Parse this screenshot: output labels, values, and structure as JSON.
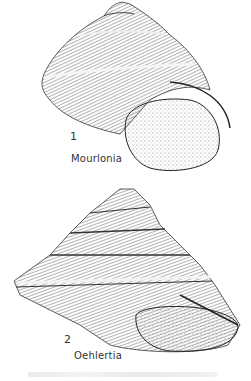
{
  "figures": [
    {
      "number": "1",
      "genus": "Mourlonia"
    },
    {
      "number": "2",
      "genus": "Oehlertia"
    }
  ],
  "colors": {
    "ink": "#222222",
    "background": "#ffffff"
  }
}
